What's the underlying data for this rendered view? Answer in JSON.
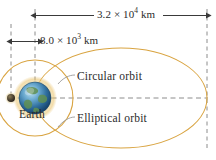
{
  "figure": {
    "background_color": "#ffffff",
    "width": 216,
    "height": 160,
    "orbit_color": "#d9a441",
    "dash_color": "#8c8c8c",
    "text_color": "#2b2b2b"
  },
  "dimensions": [
    {
      "id": "outer-span",
      "value": "3.2",
      "times": "×",
      "base": "10",
      "exponent": "4",
      "unit": "km",
      "full_text": "3.2 × 10⁴ km",
      "describes": "major axis span of elliptical orbit"
    },
    {
      "id": "inner-span",
      "value": "8.0",
      "times": "×",
      "base": "10",
      "exponent": "3",
      "unit": "km",
      "full_text": "8.0 × 10³ km",
      "describes": "distance from focus to circular orbit center"
    }
  ],
  "labels": {
    "circular_orbit": "Circular orbit",
    "elliptical_orbit": "Elliptical orbit",
    "earth": "Earth"
  },
  "shapes": {
    "ellipse": {
      "cx": 121,
      "cy": 98,
      "rx": 86,
      "ry": 50,
      "name": "elliptical-orbit"
    },
    "circle": {
      "cx": 35,
      "cy": 98,
      "r": 38,
      "name": "circular-orbit"
    },
    "earth_globe": {
      "cx": 35,
      "cy": 98,
      "r": 17,
      "name": "earth-globe"
    },
    "focus_marker": {
      "cx": 11,
      "cy": 98,
      "r": 4,
      "name": "focus-point"
    }
  },
  "guides": {
    "vertical_dashed_x": [
      11,
      35,
      207
    ],
    "horizontal_dashed_y": 98
  }
}
